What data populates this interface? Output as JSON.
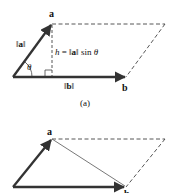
{
  "figure_a": {
    "caption": "(a)",
    "vector_a_label": "a",
    "vector_b_label": "b",
    "norm_a_label": "‖a‖",
    "norm_a": {
      "bar_left": "‖",
      "sym": "a",
      "bar_right": "‖"
    },
    "norm_b": {
      "bar_left": "‖",
      "sym": "b",
      "bar_right": "‖"
    },
    "angle_label": "θ",
    "height_formula": {
      "h": "h",
      "eq": " = ",
      "bar_left": "‖",
      "sym": "a",
      "bar_right": "‖",
      "sin": " sin ",
      "theta": "θ"
    }
  },
  "figure_b": {
    "vector_a_label": "a",
    "vector_b_label": "b"
  },
  "colors": {
    "vector": "#333333",
    "dashed": "#444444",
    "text": "#111111"
  }
}
